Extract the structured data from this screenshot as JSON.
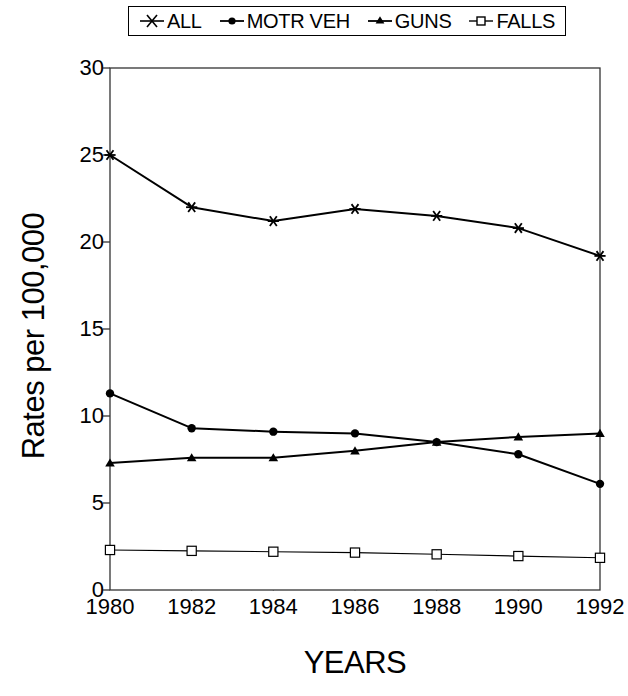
{
  "chart_data": {
    "type": "line",
    "title": "",
    "xlabel": "YEARS",
    "ylabel": "Rates per 100,000",
    "x": [
      1980,
      1982,
      1984,
      1986,
      1988,
      1990,
      1992
    ],
    "xticklabels": [
      "1980",
      "1982",
      "1984",
      "1986",
      "1988",
      "1990",
      "1992"
    ],
    "yticklabels": [
      "0",
      "5",
      "10",
      "15",
      "20",
      "25",
      "30"
    ],
    "yticks": [
      0,
      5,
      10,
      15,
      20,
      25,
      30
    ],
    "xlim": [
      1980,
      1992
    ],
    "ylim": [
      0,
      30
    ],
    "grid": false,
    "legend_position": "top-center",
    "series": [
      {
        "name": "ALL",
        "marker": "star",
        "color": "#000000",
        "values": [
          25.0,
          22.0,
          21.2,
          21.9,
          21.5,
          20.8,
          19.2
        ]
      },
      {
        "name": "MOTR VEH",
        "marker": "circle",
        "color": "#000000",
        "values": [
          11.3,
          9.3,
          9.1,
          9.0,
          8.5,
          7.8,
          6.1
        ]
      },
      {
        "name": "GUNS",
        "marker": "triangle",
        "color": "#000000",
        "values": [
          7.3,
          7.6,
          7.6,
          8.0,
          8.5,
          8.8,
          9.0
        ]
      },
      {
        "name": "FALLS",
        "marker": "square-open",
        "color": "#000000",
        "values": [
          2.3,
          2.25,
          2.2,
          2.15,
          2.05,
          1.95,
          1.85
        ]
      }
    ]
  },
  "legend": {
    "entries": [
      {
        "label": "ALL",
        "icon": "star-marker-icon"
      },
      {
        "label": "MOTR VEH",
        "icon": "circle-marker-icon"
      },
      {
        "label": "GUNS",
        "icon": "triangle-marker-icon"
      },
      {
        "label": "FALLS",
        "icon": "square-marker-icon"
      }
    ]
  }
}
